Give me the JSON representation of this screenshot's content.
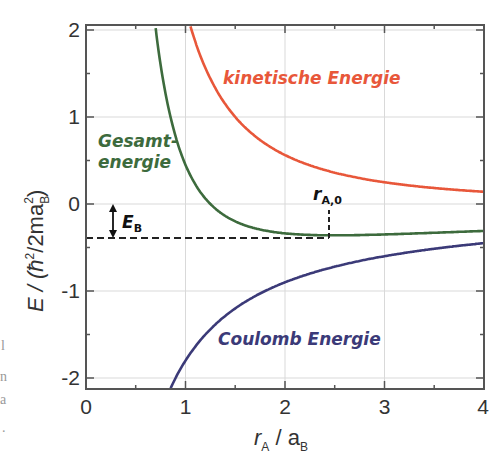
{
  "chart_data": {
    "type": "line",
    "title": "",
    "xlabel": "r_A / a_B",
    "ylabel": "E / (ħ²/2ma_B²)",
    "xlim": [
      0,
      4
    ],
    "ylim": [
      -2.13,
      2.1
    ],
    "grid": true,
    "x_ticks": [
      "0",
      "1",
      "2",
      "3",
      "4"
    ],
    "y_ticks": [
      "2",
      "1",
      "0",
      "-1",
      "-2"
    ],
    "series": [
      {
        "name": "kinetische Energie",
        "color": "#e8573a",
        "formula": "2.25/r^2",
        "x": [
          1.04,
          1.25,
          1.5,
          2,
          2.5,
          3,
          3.5,
          4
        ],
        "values": [
          2.08,
          1.44,
          1.0,
          0.56,
          0.36,
          0.25,
          0.18,
          0.14
        ]
      },
      {
        "name": "Gesamtenergie",
        "color": "#3d6b3d",
        "formula": "2.25/r^2 - 1.8/r",
        "x": [
          0.7,
          0.85,
          1.0,
          1.25,
          1.5,
          2,
          2.5,
          3,
          3.5,
          4
        ],
        "values": [
          2.02,
          0.99,
          0.45,
          0.0,
          -0.2,
          -0.34,
          -0.36,
          -0.35,
          -0.33,
          -0.31
        ]
      },
      {
        "name": "Coulomb Energie",
        "color": "#3b3a78",
        "formula": "-1.8/r",
        "x": [
          0.85,
          1,
          1.5,
          2,
          2.5,
          3,
          3.5,
          4
        ],
        "values": [
          -2.12,
          -1.8,
          -1.2,
          -0.9,
          -0.72,
          -0.6,
          -0.51,
          -0.45
        ]
      }
    ],
    "annotations": [
      {
        "text": "E_B",
        "type": "double-arrow",
        "from": 0,
        "to": -0.38,
        "x": 0.27
      },
      {
        "text": "r_A,0",
        "type": "vertical-dashed-marker",
        "x": 2.45,
        "y_from": -0.38,
        "y_to": -0.05
      },
      {
        "type": "horizontal-dashed-line",
        "y": -0.38,
        "x_from": 0,
        "x_to": 2.45
      }
    ]
  },
  "labels": {
    "kinetic": "kinetische Energie",
    "total_line1": "Gesamt-",
    "total_line2": "energie",
    "coulomb": "Coulomb Energie",
    "eb_main": "E",
    "eb_sub": "B",
    "r0_main": "r",
    "r0_sub": "A,0",
    "x_title_main": "r",
    "x_title_sub1": "A",
    "x_title_mid": " / a",
    "x_title_sub2": "B",
    "y_title_a": "E / (ħ",
    "y_title_sup1": "2",
    "y_title_b": "/2ma",
    "y_title_sub": "B",
    "y_title_sup2": "2",
    "y_title_c": ")"
  },
  "ticks": {
    "x": [
      "0",
      "1",
      "2",
      "3",
      "4"
    ],
    "y": [
      "2",
      "1",
      "0",
      "-1",
      "-2"
    ]
  },
  "margin_marks": [
    "l",
    "n",
    "a",
    "."
  ]
}
